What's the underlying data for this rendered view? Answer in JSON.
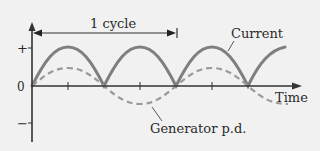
{
  "diagram": {
    "title": "",
    "colors": {
      "background": "#f1f1f1",
      "axis": "#333333",
      "current": "#808080",
      "generator": "#9a9a9a",
      "text": "#2a2a2a"
    },
    "axes": {
      "y_labels": {
        "plus": "+",
        "zero": "0",
        "minus": "−"
      },
      "x_label": "Time"
    },
    "annotations": {
      "cycle_label": "1 cycle",
      "current_label": "Current",
      "generator_label": "Generator p.d."
    },
    "curves": [
      {
        "name": "Current",
        "style": "solid",
        "shape": "full-wave rectified |sin|",
        "amplitude": "+"
      },
      {
        "name": "Generator p.d.",
        "style": "dashed",
        "shape": "sine",
        "amplitude": "smaller than current"
      }
    ]
  }
}
